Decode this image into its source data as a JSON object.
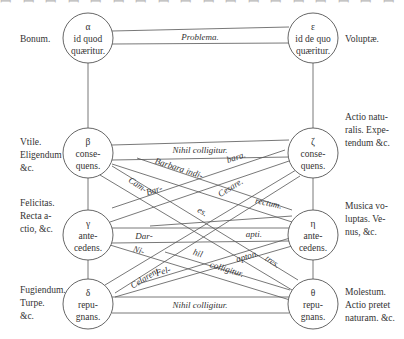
{
  "top_clipped_text": "ꟷ ꟷ ꟷ ꟷ ꟷ ꟷ ꟷ ꟷ ꟷ ꟷ ꟷ ꟷ ꟷ ꟷ ꟷ ꟷ ꟷ ꟷ ꟷ ꟷ ꟷ ꟷ ꟷ ꟷ",
  "nodes": {
    "alpha": {
      "letter": "α",
      "line1": "id quod",
      "line2": "quærit­ur."
    },
    "epsilon": {
      "letter": "ε",
      "line1": "id de quo",
      "line2": "quæritur."
    },
    "beta": {
      "letter": "β",
      "line1": "conse-",
      "line2": "quens."
    },
    "zeta": {
      "letter": "ζ",
      "line1": "conse-",
      "line2": "quens."
    },
    "gamma": {
      "letter": "γ",
      "line1": "ante-",
      "line2": "cedens."
    },
    "eta": {
      "letter": "η",
      "line1": "ante-",
      "line2": "cedens."
    },
    "delta": {
      "letter": "δ",
      "line1": "repu-",
      "line2": "gnans."
    },
    "theta": {
      "letter": "θ",
      "line1": "repu-",
      "line2": "gnans."
    }
  },
  "left_labels": {
    "alpha": [
      "Bonum."
    ],
    "beta": [
      "Vtile.",
      "Eligendum",
      "&c."
    ],
    "gamma": [
      "Felicitas.",
      "Recta a-",
      "ctio, &c."
    ],
    "delta": [
      "Fugiendum.",
      "Turpe.",
      "&c."
    ]
  },
  "right_labels": {
    "epsilon": [
      "Voluptæ."
    ],
    "zeta": [
      "Actio natu-",
      "ralis. Expe-",
      "tendum &c."
    ],
    "eta": [
      "Musica vo-",
      "luptas. Ve-",
      "nus, &c."
    ],
    "theta": [
      "Molestum.",
      "Actio pretet",
      "naturam. &c."
    ]
  },
  "band_labels": {
    "problema": "Problema.",
    "nihil_top": "Nihil colligitur.",
    "nihil_bottom": "Nihil colligitur.",
    "cam": "Cam-",
    "barbara_indi": "Barbara  indi-",
    "bara": "bara.",
    "bar": "Bar-",
    "es": "es.",
    "cesare": "Cesare.",
    "rectum": "rectum.",
    "dar": "Dar-",
    "apti": "apti.",
    "ni": "Ni-",
    "celarent": "Celarent.",
    "hil": "hil",
    "apton": "apton.",
    "fel": "Fel-",
    "colligitur": "colligitur.",
    "tres": "tres."
  },
  "colors": {
    "stroke": "#555555",
    "text": "#333333",
    "background": "#ffffff"
  }
}
